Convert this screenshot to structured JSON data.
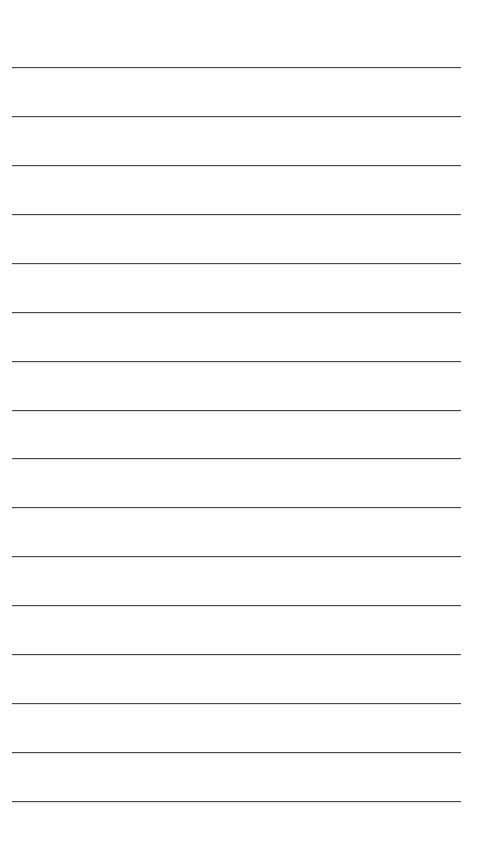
{
  "page": {
    "type": "blank-ruled-paper",
    "background_color": "#fefefe",
    "line_color": "#4a4a4a",
    "line_count": 16,
    "line_left": 12,
    "line_width": 449,
    "line_positions_y": [
      67,
      116,
      165,
      214,
      263,
      312,
      361,
      410,
      458,
      507,
      556,
      605,
      654,
      703,
      752,
      801
    ]
  }
}
